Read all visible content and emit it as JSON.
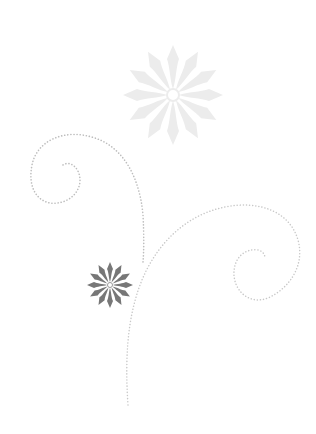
{
  "image": {
    "width": 316,
    "height": 434,
    "background": "#ffffff",
    "description": "Decorative floral swirl ornament"
  },
  "ornaments": {
    "large_flower": {
      "cx": 173,
      "cy": 95,
      "radius": 50,
      "color": "#ececec",
      "petals": 12
    },
    "small_flower": {
      "cx": 110,
      "cy": 285,
      "radius": 23,
      "color": "#777777",
      "petals": 12
    },
    "swirl_left": {
      "color": "#bdbdbd"
    },
    "swirl_right": {
      "color": "#c8c8c8"
    }
  }
}
